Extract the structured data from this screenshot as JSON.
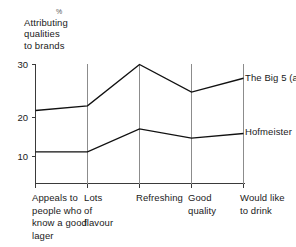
{
  "chart_data": {
    "type": "line",
    "title": "% Attributing qualities to brands",
    "title_parts": {
      "unit": "%",
      "lines": [
        "Attributing",
        "qualities",
        "to brands"
      ]
    },
    "xlabel": "",
    "ylabel": "",
    "ylim": [
      0,
      30
    ],
    "yticks": [
      30,
      20,
      10
    ],
    "grid": "vertical",
    "legend_position": "right-inline",
    "categories": [
      "Appeals to people who know a good lager",
      "Lots of flavour",
      "Refreshing",
      "Good quality",
      "Would like to drink"
    ],
    "category_lines": [
      [
        "Appeals to",
        "people who",
        "know a good",
        "lager"
      ],
      [
        "Lots",
        "of",
        "flavour"
      ],
      [
        "Refreshing"
      ],
      [
        "Good",
        "quality"
      ],
      [
        "Would like",
        "to drink"
      ]
    ],
    "series": [
      {
        "name": "The Big 5 (average)",
        "name_lines": [
          "The Big 5",
          "(average)"
        ],
        "color": "#111111",
        "values": [
          20,
          21,
          30,
          24,
          27
        ]
      },
      {
        "name": "Hofmeister",
        "name_lines": [
          "Hofmeister"
        ],
        "color": "#111111",
        "values": [
          11,
          11,
          16,
          14,
          15
        ]
      }
    ]
  },
  "axis": {
    "tick_30": "30",
    "tick_20": "20",
    "tick_10": "10"
  },
  "series_labels": {
    "big5_line1": "The Big 5",
    "big5_line2": "(average)",
    "hofmeister": "Hofmeister"
  },
  "categories_text": {
    "c0_l0": "Appeals to",
    "c0_l1": "people who",
    "c0_l2": "know a good",
    "c0_l3": "lager",
    "c1_l0": "Lots",
    "c1_l1": "of",
    "c1_l2": "flavour",
    "c2_l0": "Refreshing",
    "c3_l0": "Good",
    "c3_l1": "quality",
    "c4_l0": "Would like",
    "c4_l1": "to drink"
  },
  "title_text": {
    "unit": "%",
    "l0": "Attributing",
    "l1": "qualities",
    "l2": "to brands"
  },
  "colors": {
    "line": "#111111",
    "axis": "#3a3a3a",
    "grid": "#8c8c8c",
    "background": "#ffffff"
  }
}
